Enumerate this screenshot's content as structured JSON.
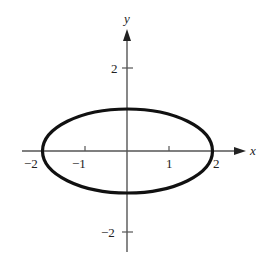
{
  "figure": {
    "type": "ellipse-graph",
    "equation": "x^2/4 + y^2 = 1",
    "axes": {
      "x_label": "x",
      "y_label": "y",
      "x_ticks": [
        {
          "value": -2,
          "label": "−2"
        },
        {
          "value": -1,
          "label": "−1"
        },
        {
          "value": 1,
          "label": "1"
        },
        {
          "value": 2,
          "label": "2"
        }
      ],
      "y_ticks": [
        {
          "value": 2,
          "label": "2"
        },
        {
          "value": -2,
          "label": "−2"
        }
      ]
    },
    "ellipse": {
      "center": [
        0,
        0
      ],
      "semi_major_x": 2,
      "semi_minor_y": 1,
      "stroke_color": "#111111"
    },
    "axis_color": "#555555"
  },
  "labels": {
    "x_axis": "x",
    "y_axis": "y",
    "xt_m2": "−2",
    "xt_m1": "−1",
    "xt_1": "1",
    "xt_2": "2",
    "yt_2": "2",
    "yt_m2": "−2"
  }
}
